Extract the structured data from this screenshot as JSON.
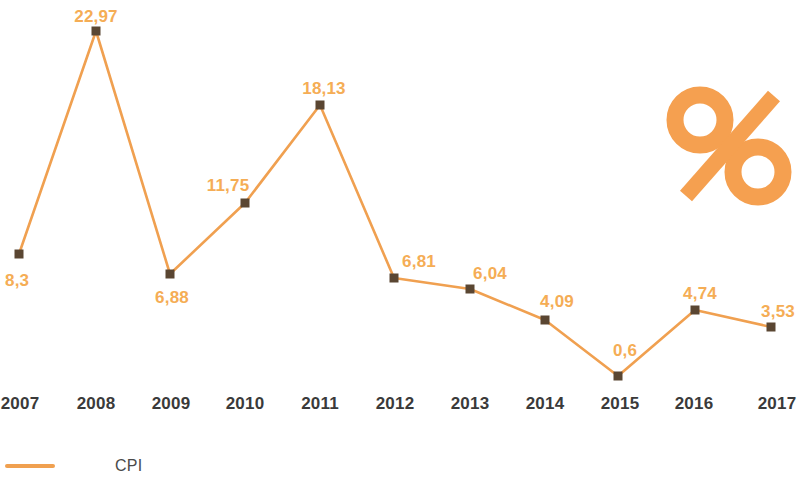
{
  "chart_data": {
    "type": "line",
    "title": "",
    "subtitle": "",
    "xlabel": "",
    "ylabel": "",
    "categories": [
      "2007",
      "2008",
      "2009",
      "2010",
      "2011",
      "2012",
      "2013",
      "2014",
      "2015",
      "2016",
      "2017"
    ],
    "series": [
      {
        "name": "CPI",
        "values": [
          8.3,
          22.97,
          6.88,
          11.75,
          18.13,
          6.81,
          6.04,
          4.09,
          0.6,
          4.74,
          3.53
        ],
        "value_labels": [
          "8,3",
          "22,97",
          "6,88",
          "11,75",
          "18,13",
          "6,81",
          "6,04",
          "4,09",
          "0,6",
          "4,74",
          "3,53"
        ],
        "color": "#f0a050",
        "marker_color": "#5a4632",
        "marker_shape": "square"
      }
    ],
    "ylim": [
      0,
      24
    ],
    "grid": false,
    "axis_visible": false,
    "legend": {
      "position": "bottom-left",
      "entries": [
        {
          "label": "CPI",
          "color": "#f0a050"
        }
      ]
    },
    "annotations": [
      {
        "name": "percent-symbol",
        "text": "%",
        "color": "#f5a050"
      }
    ],
    "points": [
      {
        "category": "2007",
        "value": 8.3,
        "label": "8,3",
        "x": 19,
        "y": 254,
        "label_x": 19,
        "label_y": 272,
        "label_anchor": "start"
      },
      {
        "category": "2008",
        "value": 22.97,
        "label": "22,97",
        "x": 96,
        "y": 31,
        "label_x": 96,
        "label_y": 8,
        "label_anchor": "middle"
      },
      {
        "category": "2009",
        "value": 6.88,
        "label": "6,88",
        "x": 170,
        "y": 274,
        "label_x": 172,
        "label_y": 289,
        "label_anchor": "middle"
      },
      {
        "category": "2010",
        "value": 11.75,
        "label": "11,75",
        "x": 245,
        "y": 203,
        "label_x": 228,
        "label_y": 177,
        "label_anchor": "middle"
      },
      {
        "category": "2011",
        "value": 18.13,
        "label": "18,13",
        "x": 320,
        "y": 105,
        "label_x": 324,
        "label_y": 80,
        "label_anchor": "middle"
      },
      {
        "category": "2012",
        "value": 6.81,
        "label": "6,81",
        "x": 394,
        "y": 278,
        "label_x": 419,
        "label_y": 253,
        "label_anchor": "middle"
      },
      {
        "category": "2013",
        "value": 6.04,
        "label": "6,04",
        "x": 470,
        "y": 289,
        "label_x": 490,
        "label_y": 265,
        "label_anchor": "middle"
      },
      {
        "category": "2014",
        "value": 4.09,
        "label": "4,09",
        "x": 545,
        "y": 320,
        "label_x": 557,
        "label_y": 293,
        "label_anchor": "middle"
      },
      {
        "category": "2015",
        "value": 0.6,
        "label": "0,6",
        "x": 618,
        "y": 376,
        "label_x": 625,
        "label_y": 342,
        "label_anchor": "middle"
      },
      {
        "category": "2016",
        "value": 4.74,
        "label": "4,74",
        "x": 695,
        "y": 310,
        "label_x": 700,
        "label_y": 285,
        "label_anchor": "middle"
      },
      {
        "category": "2017",
        "value": 3.53,
        "label": "3,53",
        "x": 771,
        "y": 327,
        "label_x": 778,
        "label_y": 303,
        "label_anchor": "middle"
      }
    ],
    "x_tick_positions": [
      20,
      96,
      171,
      245,
      320,
      395,
      470,
      545,
      620,
      694,
      777
    ]
  },
  "colors": {
    "line": "#f0a050",
    "value_label": "#f5ad55",
    "marker": "#5a4632",
    "axis_label": "#3a3a3a",
    "legend_text": "#4a4a4a",
    "background": "#ffffff"
  }
}
